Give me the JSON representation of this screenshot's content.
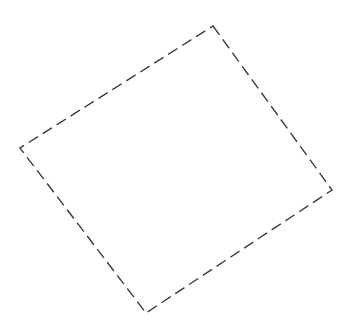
{
  "canvas": {
    "width": 350,
    "height": 326,
    "background_color": "#ffffff",
    "title": "Dashed quadrilateral outline"
  },
  "shape": {
    "name": "rotated-square",
    "kind": "quadrilateral",
    "closed": true,
    "stroke_color": "#3b3b42",
    "stroke_width": 1.4,
    "fill": "none",
    "dash_length": 11,
    "dash_gap": 5.5,
    "dash_array": "11 5.5",
    "path": "M 213 26 L 332 190 L 146 313 L 20 148 Z",
    "vertices": [
      {
        "name": "top-vertex",
        "x": 213,
        "y": 26
      },
      {
        "name": "right-vertex",
        "x": 332,
        "y": 190
      },
      {
        "name": "bottom-vertex",
        "x": 146,
        "y": 313
      },
      {
        "name": "left-vertex",
        "x": 20,
        "y": 148
      }
    ],
    "edges": [
      {
        "name": "top-right-edge",
        "from": "top-vertex",
        "to": "right-vertex"
      },
      {
        "name": "bottom-right-edge",
        "from": "right-vertex",
        "to": "bottom-vertex"
      },
      {
        "name": "bottom-left-edge",
        "from": "bottom-vertex",
        "to": "left-vertex"
      },
      {
        "name": "top-left-edge",
        "from": "left-vertex",
        "to": "top-vertex"
      }
    ]
  }
}
